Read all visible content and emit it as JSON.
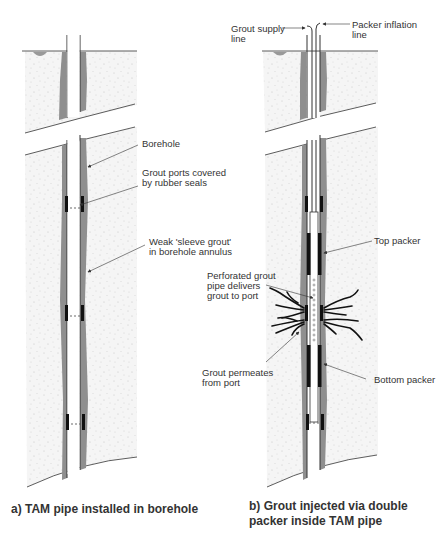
{
  "colors": {
    "soil": "#f4f4f4",
    "soil_speckle": "#d0d0d0",
    "sleeve_grout": "#8f8f8f",
    "pipe_outline": "#333333",
    "seal": "#111111",
    "arrow": "#333333",
    "text": "#333333"
  },
  "panel_a": {
    "caption": "a) TAM pipe installed in borehole",
    "labels": {
      "borehole": "Borehole",
      "grout_ports_1": "Grout ports covered",
      "grout_ports_2": "by rubber seals",
      "sleeve_grout_1": "Weak 'sleeve grout'",
      "sleeve_grout_2": "in borehole annulus"
    }
  },
  "panel_b": {
    "caption_1": "b) Grout injected via double",
    "caption_2": "packer inside TAM pipe",
    "labels": {
      "grout_supply_1": "Grout supply",
      "grout_supply_2": "line",
      "packer_inflation_1": "Packer inflation",
      "packer_inflation_2": "line",
      "top_packer": "Top packer",
      "perforated_1": "Perforated grout",
      "perforated_2": "pipe delivers",
      "perforated_3": "grout to port",
      "permeates_1": "Grout permeates",
      "permeates_2": "from port",
      "bottom_packer": "Bottom packer"
    }
  }
}
